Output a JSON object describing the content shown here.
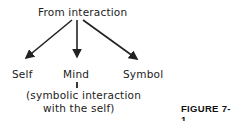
{
  "diagram": {
    "root": "From interaction",
    "children": [
      {
        "label": "Self"
      },
      {
        "label": "Mind",
        "note_line1": "(symbolic interaction",
        "note_line2": "with the self)"
      },
      {
        "label": "Symbol"
      }
    ],
    "caption": "FIGURE 7-1"
  }
}
